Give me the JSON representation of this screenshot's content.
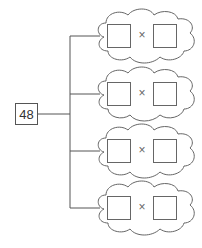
{
  "diagram": {
    "type": "factor-pairs-tree",
    "root": {
      "value": "48"
    },
    "branches": [
      {
        "left": "",
        "operator": "×",
        "right": ""
      },
      {
        "left": "",
        "operator": "×",
        "right": ""
      },
      {
        "left": "",
        "operator": "×",
        "right": ""
      },
      {
        "left": "",
        "operator": "×",
        "right": ""
      }
    ],
    "colors": {
      "line": "#555555",
      "background": "#ffffff"
    }
  }
}
